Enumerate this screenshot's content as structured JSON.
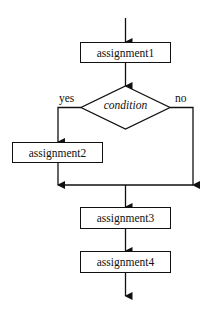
{
  "diagram": {
    "type": "flowchart",
    "nodes": [
      {
        "id": "assignment1",
        "shape": "rectangle",
        "label": "assignment1"
      },
      {
        "id": "condition",
        "shape": "diamond",
        "label": "condition"
      },
      {
        "id": "assignment2",
        "shape": "rectangle",
        "label": "assignment2"
      },
      {
        "id": "assignment3",
        "shape": "rectangle",
        "label": "assignment3"
      },
      {
        "id": "assignment4",
        "shape": "rectangle",
        "label": "assignment4"
      }
    ],
    "edges": [
      {
        "from": "start",
        "to": "assignment1"
      },
      {
        "from": "assignment1",
        "to": "condition"
      },
      {
        "from": "condition",
        "to": "assignment2",
        "label": "yes"
      },
      {
        "from": "condition",
        "to": "merge",
        "label": "no"
      },
      {
        "from": "assignment2",
        "to": "merge"
      },
      {
        "from": "merge",
        "to": "assignment3"
      },
      {
        "from": "assignment3",
        "to": "assignment4"
      },
      {
        "from": "assignment4",
        "to": "end"
      }
    ],
    "branch_labels": {
      "yes": "yes",
      "no": "no"
    }
  }
}
